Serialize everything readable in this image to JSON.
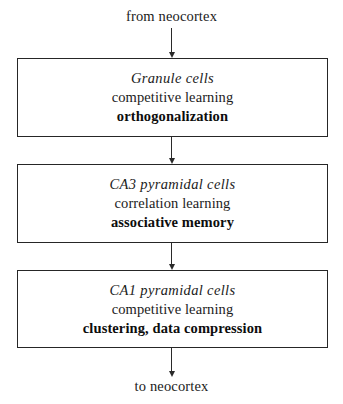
{
  "diagram": {
    "type": "flowchart",
    "orientation": "vertical",
    "input_label": "from neocortex",
    "output_label": "to neocortex",
    "line_color": "#262626",
    "text_color": "#1b1b1b",
    "background_color": "#ffffff",
    "stages": [
      {
        "id": "granule",
        "title": "Granule cells",
        "rule": "competitive learning",
        "function": "orthogonalization"
      },
      {
        "id": "ca3",
        "title": "CA3 pyramidal cells",
        "rule": "correlation learning",
        "function": "associative memory"
      },
      {
        "id": "ca1",
        "title": "CA1 pyramidal cells",
        "rule": "competitive learning",
        "function": "clustering, data compression"
      }
    ],
    "connectors": [
      {
        "id": "arrow-in",
        "from": "input",
        "to": "granule"
      },
      {
        "id": "arrow-1-2",
        "from": "granule",
        "to": "ca3"
      },
      {
        "id": "arrow-2-3",
        "from": "ca3",
        "to": "ca1"
      },
      {
        "id": "arrow-out",
        "from": "ca1",
        "to": "output"
      }
    ]
  }
}
